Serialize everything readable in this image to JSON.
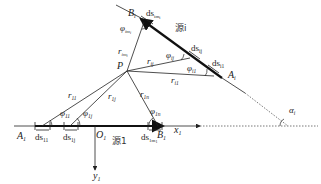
{
  "diagram": {
    "type": "geometry-schematic",
    "colors": {
      "line": "#222222",
      "text": "#222222",
      "background": "#ffffff"
    },
    "points": {
      "P": {
        "label": "P"
      },
      "A1": {
        "label": "A",
        "sub": "1"
      },
      "B1": {
        "label": "B",
        "sub": "1"
      },
      "O1": {
        "label": "O",
        "sub": "1"
      },
      "Ai": {
        "label": "A",
        "sub": "i"
      },
      "Bi": {
        "label": "B",
        "sub": "i"
      }
    },
    "axes": {
      "x1": {
        "label": "x",
        "sub": "1"
      },
      "y1": {
        "label": "y",
        "sub": "1"
      }
    },
    "sources": {
      "source1": {
        "label": "源1"
      },
      "sourcei": {
        "label": "源i"
      }
    },
    "distances": {
      "r11": {
        "label": "r",
        "sub": "11"
      },
      "r1j": {
        "label": "r",
        "sub": "1j"
      },
      "r1n": {
        "label": "r",
        "sub": "1n"
      },
      "ri1": {
        "label": "r",
        "sub": "i1"
      },
      "rij": {
        "label": "r",
        "sub": "ij"
      },
      "rimi": {
        "label": "r",
        "sub": "im",
        "subsub": "i"
      }
    },
    "angles": {
      "phi11": {
        "label": "φ",
        "sub": "11"
      },
      "phi1j": {
        "label": "φ",
        "sub": "1j"
      },
      "phi1n": {
        "label": "φ",
        "sub": "1n"
      },
      "phii1": {
        "label": "φ",
        "sub": "i1"
      },
      "phiij": {
        "label": "φ",
        "sub": "ij"
      },
      "phiimi": {
        "label": "φ",
        "sub": "im",
        "subsub": "i"
      },
      "alphai": {
        "label": "α",
        "sub": "i"
      }
    },
    "elements": {
      "ds11": {
        "label": "ds",
        "sub": "11"
      },
      "ds1j": {
        "label": "ds",
        "sub": "1j"
      },
      "ds1m1": {
        "label": "ds",
        "sub": "1m",
        "subsub": "1"
      },
      "dsi1": {
        "label": "ds",
        "sub": "i1"
      },
      "dsij": {
        "label": "ds",
        "sub": "ij"
      },
      "dsimi": {
        "label": "ds",
        "sub": "im",
        "subsub": "i"
      }
    }
  }
}
